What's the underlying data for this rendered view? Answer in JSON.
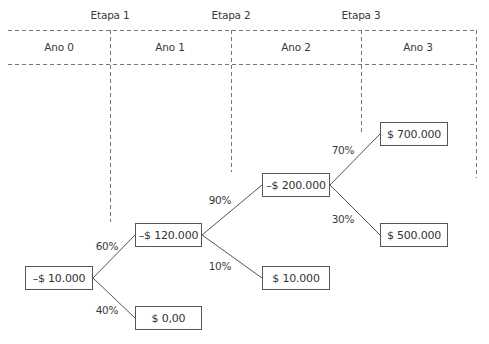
{
  "stages": [
    {
      "label": "Etapa 1",
      "x": 110,
      "y": 15
    },
    {
      "label": "Etapa 2",
      "x": 231,
      "y": 15
    },
    {
      "label": "Etapa 3",
      "x": 361,
      "y": 15
    }
  ],
  "years": [
    {
      "label": "Ano 0",
      "x": 59,
      "y": 47
    },
    {
      "label": "Ano 1",
      "x": 170,
      "y": 47
    },
    {
      "label": "Ano 2",
      "x": 296,
      "y": 47
    },
    {
      "label": "Ano 3",
      "x": 418,
      "y": 47
    }
  ],
  "nodes": [
    {
      "id": "root",
      "value": "–$ 10.000",
      "x": 25,
      "y": 266,
      "w": 68,
      "h": 24
    },
    {
      "id": "n1_success",
      "value": "–$ 120.000",
      "x": 135,
      "y": 223,
      "w": 67,
      "h": 24
    },
    {
      "id": "n1_fail",
      "value": "$ 0,00",
      "x": 135,
      "y": 306,
      "w": 67,
      "h": 24
    },
    {
      "id": "n2_success",
      "value": "–$ 200.000",
      "x": 262,
      "y": 173,
      "w": 68,
      "h": 24
    },
    {
      "id": "n2_fail",
      "value": "$ 10.000",
      "x": 262,
      "y": 266,
      "w": 68,
      "h": 24
    },
    {
      "id": "n3_high",
      "value": "$ 700.000",
      "x": 380,
      "y": 122,
      "w": 68,
      "h": 24
    },
    {
      "id": "n3_low",
      "value": "$ 500.000",
      "x": 380,
      "y": 223,
      "w": 68,
      "h": 24
    }
  ],
  "probabilities": [
    {
      "label": "60%",
      "x": 107,
      "y": 246
    },
    {
      "label": "40%",
      "x": 107,
      "y": 310
    },
    {
      "label": "90%",
      "x": 220,
      "y": 200
    },
    {
      "label": "10%",
      "x": 220,
      "y": 266
    },
    {
      "label": "70%",
      "x": 343,
      "y": 150
    },
    {
      "label": "30%",
      "x": 343,
      "y": 219
    }
  ],
  "colors": {
    "line": "#555555",
    "dash": "#777777",
    "text": "#333333"
  }
}
